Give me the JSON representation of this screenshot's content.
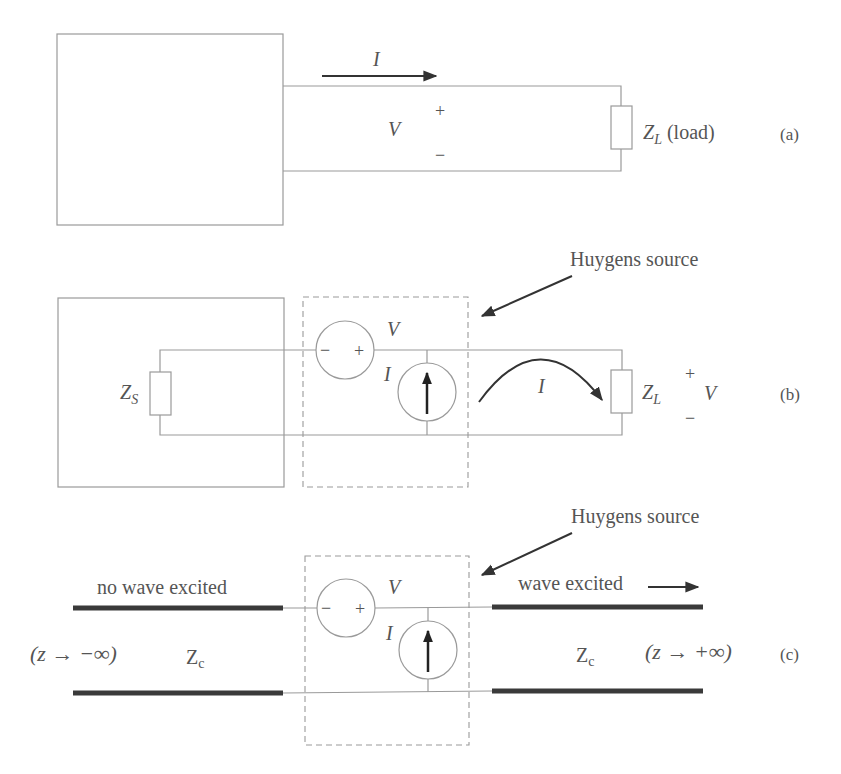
{
  "panels": {
    "a": {
      "tag": "(a)",
      "current_label": "I",
      "voltage_label": "V",
      "plus": "+",
      "minus": "−",
      "load_label_main": "Z",
      "load_label_sub": "L",
      "load_label_suffix": " (load)"
    },
    "b": {
      "tag": "(b)",
      "callout": "Huygens source",
      "source_impedance_main": "Z",
      "source_impedance_sub": "S",
      "vsource_label": "V",
      "vsource_minus": "−",
      "vsource_plus": "+",
      "isource_label": "I",
      "loop_current_label": "I",
      "load_label_main": "Z",
      "load_label_sub": "L",
      "load_plus": "+",
      "load_minus": "−",
      "load_voltage_label": "V"
    },
    "c": {
      "tag": "(c)",
      "callout": "Huygens source",
      "left_caption": "no wave excited",
      "right_caption": "wave excited",
      "vsource_label": "V",
      "vsource_minus": "−",
      "vsource_plus": "+",
      "isource_label": "I",
      "left_impedance_main": "Z",
      "left_impedance_sub": "c",
      "right_impedance_main": "Z",
      "right_impedance_sub": "c",
      "left_limit": "(z → −∞)",
      "right_limit": "(z → +∞)"
    }
  },
  "colors": {
    "wire": "#9a9a9a",
    "thick_line": "#3a3a3a",
    "text": "#555555",
    "arrow": "#333333"
  }
}
